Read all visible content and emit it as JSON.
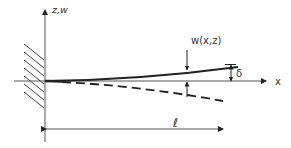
{
  "diagram": {
    "type": "cantilever-beam-deflection",
    "labels": {
      "vertical_axis": "z,w",
      "horizontal_axis": "x",
      "deflection_function": "w(x,z)",
      "tip_deflection": "δ",
      "length": "ℓ"
    },
    "elements": [
      {
        "name": "fixed-wall",
        "description": "hatched clamped support at left"
      },
      {
        "name": "z-axis",
        "description": "vertical axis with arrow up"
      },
      {
        "name": "x-axis",
        "description": "horizontal axis with arrow right"
      },
      {
        "name": "deflected-beam-solid",
        "description": "solid curve rising toward tip"
      },
      {
        "name": "deflected-beam-dashed",
        "description": "dashed curve dropping toward tip"
      },
      {
        "name": "w-marker",
        "description": "opposing arrows indicating w(x,z)"
      },
      {
        "name": "delta-marker",
        "description": "dimension arrows indicating δ"
      },
      {
        "name": "length-dimension",
        "description": "double arrow indicating length ℓ"
      }
    ],
    "colors": {
      "line": "#222222",
      "axis": "#555555",
      "text": "#333333"
    }
  }
}
